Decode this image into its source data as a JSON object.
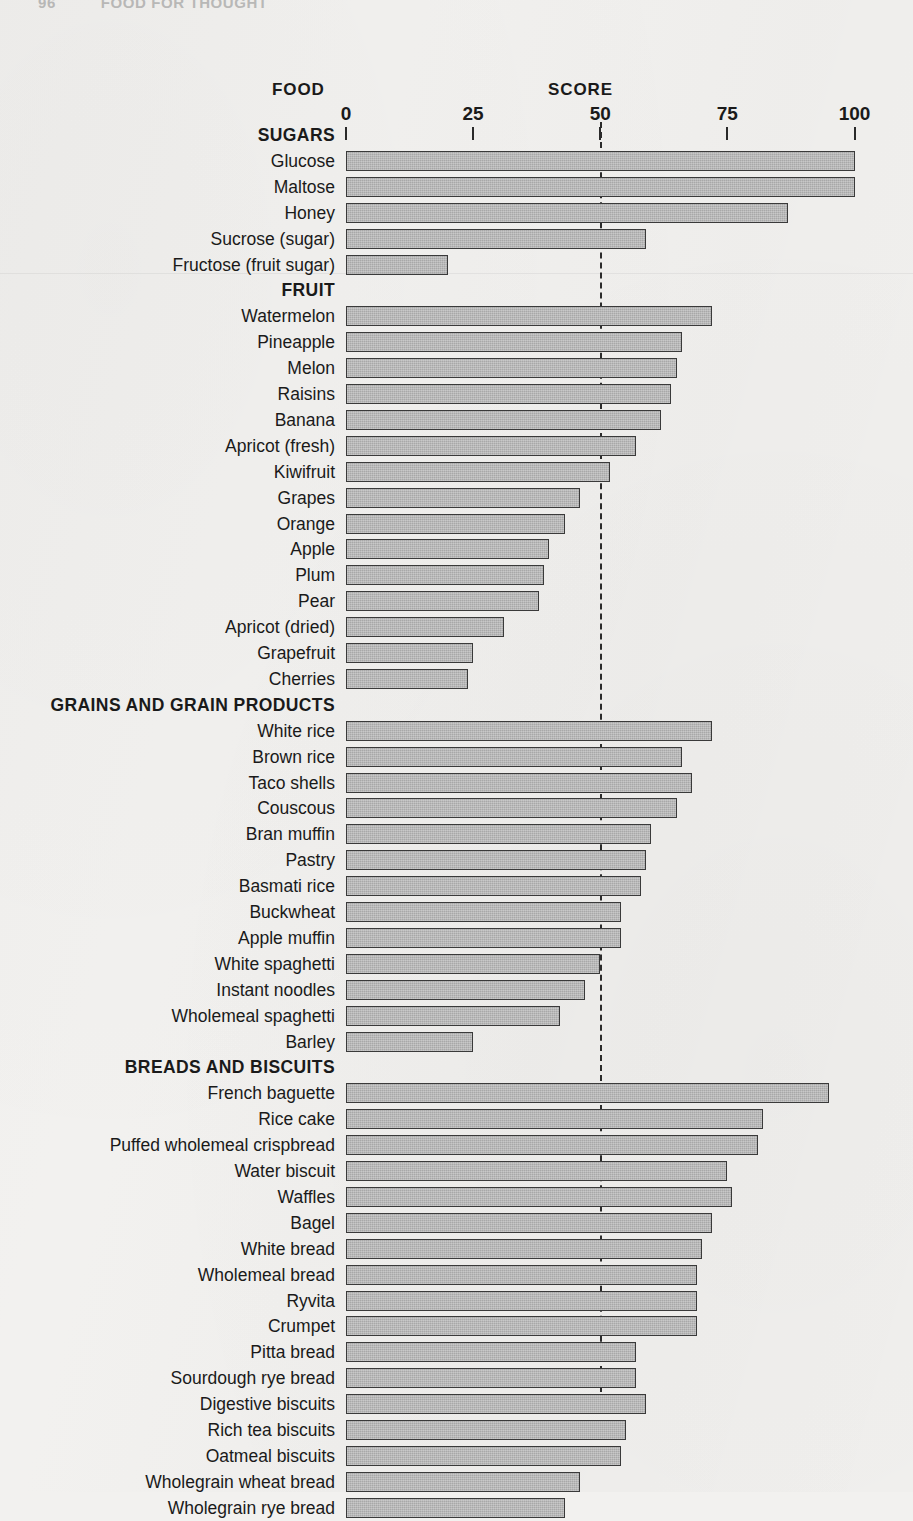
{
  "page": {
    "folio": "96",
    "running_head": "FOOD FOR THOUGHT"
  },
  "headings": {
    "food": "FOOD",
    "score": "SCORE"
  },
  "axis": {
    "ticks": [
      0,
      25,
      50,
      75,
      100
    ],
    "tick_labels": [
      "0",
      "25",
      "50",
      "75",
      "100"
    ],
    "reference_line_value": 50
  },
  "chart_data": {
    "type": "bar",
    "orientation": "horizontal",
    "title": "",
    "xlabel": "SCORE",
    "ylabel": "FOOD",
    "xlim": [
      0,
      100
    ],
    "grid": false,
    "legend": null,
    "reference_line": 50,
    "sections": [
      {
        "name": "SUGARS",
        "items": [
          {
            "label": "Glucose",
            "value": 100
          },
          {
            "label": "Maltose",
            "value": 100
          },
          {
            "label": "Honey",
            "value": 87
          },
          {
            "label": "Sucrose (sugar)",
            "value": 59
          },
          {
            "label": "Fructose (fruit sugar)",
            "value": 20
          }
        ]
      },
      {
        "name": "FRUIT",
        "items": [
          {
            "label": "Watermelon",
            "value": 72
          },
          {
            "label": "Pineapple",
            "value": 66
          },
          {
            "label": "Melon",
            "value": 65
          },
          {
            "label": "Raisins",
            "value": 64
          },
          {
            "label": "Banana",
            "value": 62
          },
          {
            "label": "Apricot (fresh)",
            "value": 57
          },
          {
            "label": "Kiwifruit",
            "value": 52
          },
          {
            "label": "Grapes",
            "value": 46
          },
          {
            "label": "Orange",
            "value": 43
          },
          {
            "label": "Apple",
            "value": 40
          },
          {
            "label": "Plum",
            "value": 39
          },
          {
            "label": "Pear",
            "value": 38
          },
          {
            "label": "Apricot (dried)",
            "value": 31
          },
          {
            "label": "Grapefruit",
            "value": 25
          },
          {
            "label": "Cherries",
            "value": 24
          }
        ]
      },
      {
        "name": "GRAINS AND GRAIN PRODUCTS",
        "items": [
          {
            "label": "White rice",
            "value": 72
          },
          {
            "label": "Brown rice",
            "value": 66
          },
          {
            "label": "Taco shells",
            "value": 68
          },
          {
            "label": "Couscous",
            "value": 65
          },
          {
            "label": "Bran muffin",
            "value": 60
          },
          {
            "label": "Pastry",
            "value": 59
          },
          {
            "label": "Basmati rice",
            "value": 58
          },
          {
            "label": "Buckwheat",
            "value": 54
          },
          {
            "label": "Apple muffin",
            "value": 54
          },
          {
            "label": "White spaghetti",
            "value": 50
          },
          {
            "label": "Instant noodles",
            "value": 47
          },
          {
            "label": "Wholemeal spaghetti",
            "value": 42
          },
          {
            "label": "Barley",
            "value": 25
          }
        ]
      },
      {
        "name": "BREADS AND BISCUITS",
        "items": [
          {
            "label": "French baguette",
            "value": 95
          },
          {
            "label": "Rice cake",
            "value": 82
          },
          {
            "label": "Puffed wholemeal crispbread",
            "value": 81
          },
          {
            "label": "Water biscuit",
            "value": 75
          },
          {
            "label": "Waffles",
            "value": 76
          },
          {
            "label": "Bagel",
            "value": 72
          },
          {
            "label": "White bread",
            "value": 70
          },
          {
            "label": "Wholemeal bread",
            "value": 69
          },
          {
            "label": "Ryvita",
            "value": 69
          },
          {
            "label": "Crumpet",
            "value": 69
          },
          {
            "label": "Pitta bread",
            "value": 57
          },
          {
            "label": "Sourdough rye bread",
            "value": 57
          },
          {
            "label": "Digestive biscuits",
            "value": 59
          },
          {
            "label": "Rich tea biscuits",
            "value": 55
          },
          {
            "label": "Oatmeal biscuits",
            "value": 54
          },
          {
            "label": "Wholegrain wheat bread",
            "value": 46
          },
          {
            "label": "Wholegrain rye bread",
            "value": 43
          }
        ]
      }
    ]
  },
  "colors": {
    "paper": "#f2f1ef",
    "bar_fill": "#a8a8a8",
    "bar_stroke": "#3a3a3a",
    "ink": "#1a1a1a"
  }
}
